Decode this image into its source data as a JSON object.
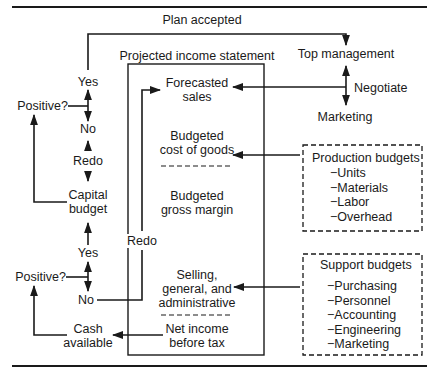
{
  "diagram": {
    "top_label": "Plan accepted",
    "income_statement": {
      "title": "Projected income statement",
      "items": [
        {
          "line1": "Forecasted",
          "line2": "sales"
        },
        {
          "line1": "Budgeted",
          "line2": "cost of goods"
        },
        {
          "line1": "Budgeted",
          "line2": "gross margin"
        },
        {
          "line1": "Selling,",
          "line2": "general, and",
          "line3": "administrative"
        },
        {
          "line1": "Net income",
          "line2": "before tax"
        }
      ]
    },
    "right": {
      "top_management": "Top management",
      "negotiate": "Negotiate",
      "marketing": "Marketing"
    },
    "production_budgets": {
      "title": "Production budgets",
      "items": [
        "Units",
        "Materials",
        "Labor",
        "Overhead"
      ]
    },
    "support_budgets": {
      "title": "Support budgets",
      "items": [
        "Purchasing",
        "Personnel",
        "Accounting",
        "Engineering",
        "Marketing"
      ]
    },
    "left": {
      "yes_top": "Yes",
      "positive_top": "Positive?",
      "no_top": "No",
      "redo_top": "Redo",
      "capital_budget_1": "Capital",
      "capital_budget_2": "budget",
      "yes_bottom": "Yes",
      "positive_bottom": "Positive?",
      "no_bottom": "No",
      "cash_1": "Cash",
      "cash_2": "available",
      "redo_mid": "Redo"
    },
    "dash": "−"
  }
}
